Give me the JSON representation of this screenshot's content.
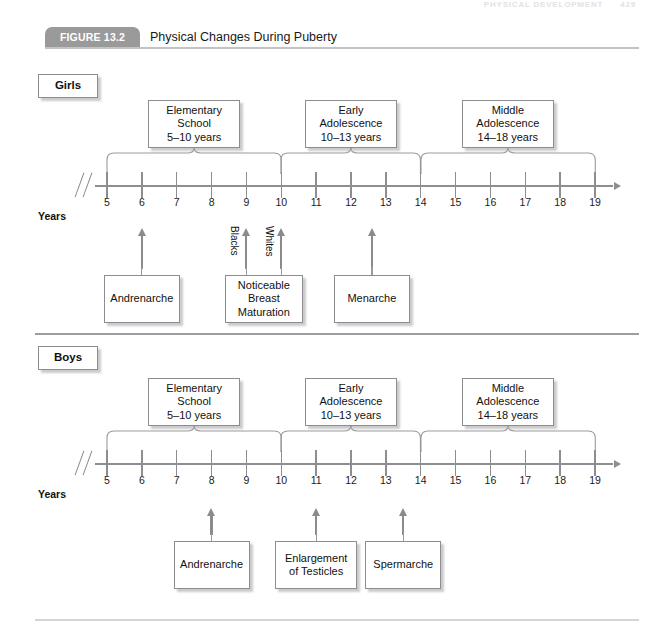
{
  "running_head": {
    "text": "PHYSICAL DEVELOPMENT",
    "page": "429"
  },
  "figure": {
    "tab_label": "FIGURE 13.2",
    "title": "Physical Changes During Puberty"
  },
  "axis": {
    "years_label": "Years",
    "ticks": [
      "5",
      "6",
      "7",
      "8",
      "9",
      "10",
      "11",
      "12",
      "13",
      "14",
      "15",
      "16",
      "17",
      "18",
      "19"
    ],
    "break_icon": "axis-break-icon",
    "arrow_icon": "axis-arrow-icon"
  },
  "sections": [
    {
      "id": "girls",
      "tag": "Girls",
      "phases": [
        {
          "name": "elementary-school",
          "lines": [
            "Elementary",
            "School",
            "5–10 years"
          ],
          "start": 5,
          "end": 10
        },
        {
          "name": "early-adolescence",
          "lines": [
            "Early",
            "Adolescence",
            "10–13 years"
          ],
          "start": 10,
          "end": 14
        },
        {
          "name": "middle-adolescence",
          "lines": [
            "Middle",
            "Adolescence",
            "14–18 years"
          ],
          "start": 14,
          "end": 19
        }
      ],
      "events": [
        {
          "name": "andrenarche",
          "lines": [
            "Andrenarche"
          ],
          "age": 6.0,
          "side_label": ""
        },
        {
          "name": "noticeable-breast-maturation",
          "lines": [
            "Noticeable",
            "Breast",
            "Maturation"
          ],
          "age": 9.0,
          "side_label": "Blacks",
          "age2": 10.0,
          "side_label2": "Whites"
        },
        {
          "name": "menarche",
          "lines": [
            "Menarche"
          ],
          "age": 12.6,
          "side_label": ""
        }
      ]
    },
    {
      "id": "boys",
      "tag": "Boys",
      "phases": [
        {
          "name": "elementary-school",
          "lines": [
            "Elementary",
            "School",
            "5–10 years"
          ],
          "start": 5,
          "end": 10
        },
        {
          "name": "early-adolescence",
          "lines": [
            "Early",
            "Adolescence",
            "10–13 years"
          ],
          "start": 10,
          "end": 14
        },
        {
          "name": "middle-adolescence",
          "lines": [
            "Middle",
            "Adolescence",
            "14–18 years"
          ],
          "start": 14,
          "end": 19
        }
      ],
      "events": [
        {
          "name": "andrenarche",
          "lines": [
            "Andrenarche"
          ],
          "age": 8.0,
          "side_label": ""
        },
        {
          "name": "enlargement-of-testicles",
          "lines": [
            "Enlargement",
            "of Testicles"
          ],
          "age": 11.0,
          "side_label": ""
        },
        {
          "name": "spermarche",
          "lines": [
            "Spermarche"
          ],
          "age": 13.5,
          "side_label": ""
        }
      ]
    }
  ],
  "colors": {
    "tab_bg": "#9a9a9a",
    "line": "#8e8e92",
    "box_border": "#8d8d91",
    "text": "#1a1a1a"
  }
}
